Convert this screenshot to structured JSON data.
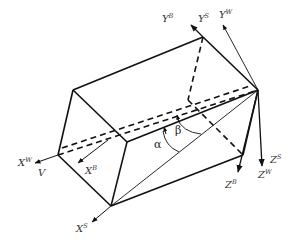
{
  "diagram": {
    "type": "coordinate-frames-prism",
    "colors": {
      "line": "#111111",
      "label": "#333333",
      "background": "#ffffff"
    },
    "labels": {
      "YB": {
        "base": "Y",
        "sup": "B"
      },
      "YS": {
        "base": "Y",
        "sup": "S"
      },
      "YW": {
        "base": "Y",
        "sup": "W"
      },
      "XW": {
        "base": "X",
        "sup": "W"
      },
      "V": {
        "base": "V"
      },
      "XB": {
        "base": "X",
        "sup": "B"
      },
      "XS": {
        "base": "X",
        "sup": "S"
      },
      "ZB": {
        "base": "Z",
        "sup": "B"
      },
      "ZS": {
        "base": "Z",
        "sup": "S"
      },
      "ZW": {
        "base": "Z",
        "sup": "W"
      },
      "alpha": "α",
      "beta": "β"
    }
  }
}
